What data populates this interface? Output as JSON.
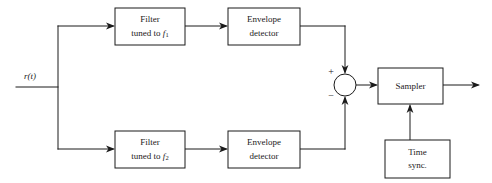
{
  "diagram": {
    "type": "block-diagram",
    "background_color": "#ffffff",
    "line_color": "#1a1a1a",
    "input": {
      "label": "r(t)",
      "label_plain": "r(t)"
    },
    "blocks": [
      {
        "id": "filter-f1",
        "line1": "Filter",
        "line2_prefix": "tuned to ",
        "line2_symbol": "f",
        "line2_subscript": "1",
        "full_text": "Filter tuned to f1"
      },
      {
        "id": "envelope-detector-top",
        "line1": "Envelope",
        "line2": "detector",
        "full_text": "Envelope detector"
      },
      {
        "id": "filter-f2",
        "line1": "Filter",
        "line2_prefix": "tuned to ",
        "line2_symbol": "f",
        "line2_subscript": "2",
        "full_text": "Filter tuned to f2"
      },
      {
        "id": "envelope-detector-bottom",
        "line1": "Envelope",
        "line2": "detector",
        "full_text": "Envelope detector"
      },
      {
        "id": "sampler",
        "line1": "Sampler",
        "full_text": "Sampler"
      },
      {
        "id": "time-sync",
        "line1": "Time",
        "line2": "sync.",
        "full_text": "Time sync."
      }
    ],
    "summing_junction": {
      "id": "summing-junction",
      "plus_sign": "+",
      "minus_sign": "−",
      "plus_input": "top-branch",
      "minus_input": "bottom-branch"
    },
    "icons": {
      "arrow": "arrow-head-icon"
    }
  }
}
